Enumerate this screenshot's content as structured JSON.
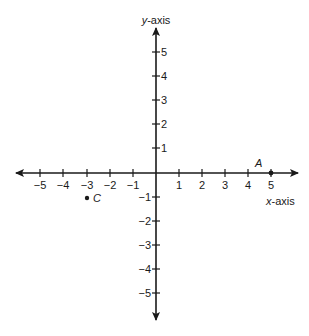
{
  "diagram": {
    "type": "coordinate-plane",
    "x_axis": {
      "label_var": "x",
      "label_suffix": "-axis",
      "range": [
        -5,
        5
      ],
      "ticks": [
        -5,
        -4,
        -3,
        -2,
        -1,
        1,
        2,
        3,
        4,
        5
      ],
      "tick_labels": [
        "−5",
        "−4",
        "−3",
        "−2",
        "−1",
        "1",
        "2",
        "3",
        "4",
        "5"
      ]
    },
    "y_axis": {
      "label_var": "y",
      "label_suffix": "-axis",
      "range": [
        -5,
        5
      ],
      "ticks": [
        5,
        4,
        3,
        2,
        1,
        -1,
        -2,
        -3,
        -4,
        -5
      ],
      "tick_labels": [
        "5",
        "4",
        "3",
        "2",
        "1",
        "−1",
        "−2",
        "−3",
        "−4",
        "−5"
      ]
    },
    "points": [
      {
        "name": "A",
        "x": 5,
        "y": 0
      },
      {
        "name": "C",
        "x": -3,
        "y": -1
      }
    ],
    "colors": {
      "ink": "#1a1a1a",
      "background": "#ffffff"
    }
  }
}
